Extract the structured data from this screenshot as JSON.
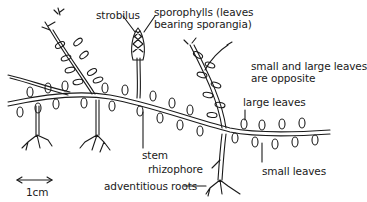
{
  "diagram": {
    "labels": {
      "strobilus": "strobilus",
      "sporophylls_line1": "sporophylls (leaves",
      "sporophylls_line2": "bearing sporangia)",
      "opposite_line1": "small and large leaves",
      "opposite_line2": "are opposite",
      "large_leaves": "large leaves",
      "stem": "stem",
      "rhizophore": "rhizophore",
      "small_leaves": "small leaves",
      "adventitious_roots": "adventitious roots",
      "scale": "1cm"
    },
    "colors": {
      "ink": "#1a1a1a",
      "background": "#ffffff"
    }
  }
}
